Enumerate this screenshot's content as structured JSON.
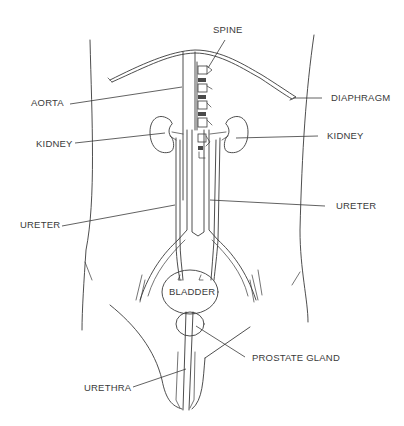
{
  "diagram": {
    "labels": {
      "spine": "SPINE",
      "aorta": "AORTA",
      "diaphragm": "DIAPHRAGM",
      "kidney_left": "KIDNEY",
      "kidney_right": "KIDNEY",
      "ureter_left": "URETER",
      "ureter_right": "URETER",
      "bladder": "BLADDER",
      "prostate_gland": "PROSTATE GLAND",
      "urethra": "URETHRA"
    },
    "colors": {
      "line": "#3a3a3a",
      "background": "#ffffff"
    }
  }
}
